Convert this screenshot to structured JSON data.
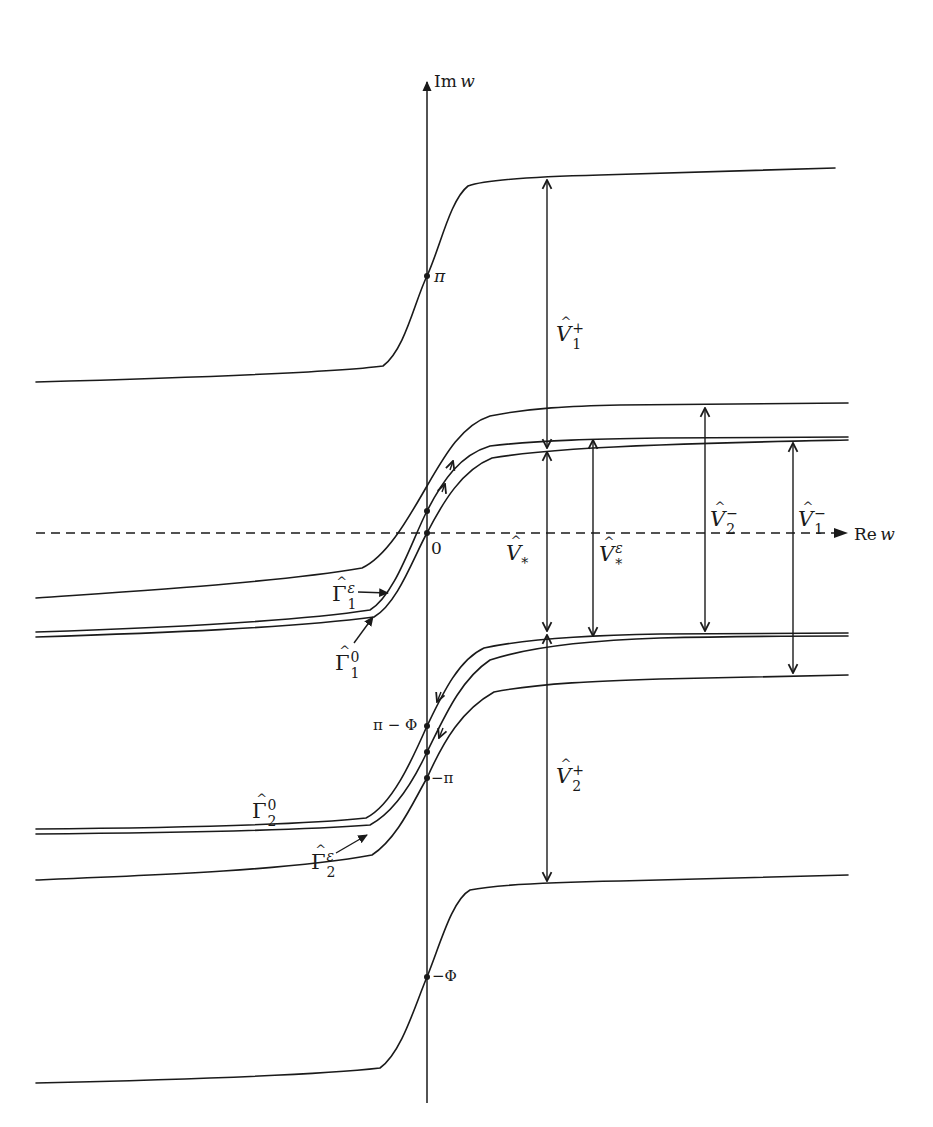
{
  "page": {
    "clipped_header_text": "",
    "figure_type": "complex w-plane sketch of strip boundaries and contours"
  },
  "axes": {
    "x_label": "Re w",
    "x_label_parts": {
      "prefix": "Re",
      "var": "w"
    },
    "y_label": "Im w",
    "y_label_parts": {
      "prefix": "Im",
      "var": "w"
    },
    "origin_label": "0",
    "x_axis_style": "dashed"
  },
  "axis_points": [
    {
      "id": "pi",
      "label": "π",
      "y": 276
    },
    {
      "id": "zero",
      "label": "0",
      "y": 533
    },
    {
      "id": "pi-minus-phi",
      "label": "π − Φ",
      "y": 726
    },
    {
      "id": "minus-pi",
      "label": "−π",
      "y": 778
    },
    {
      "id": "minus-phi",
      "label": "−Φ",
      "y": 977
    }
  ],
  "curves": [
    {
      "id": "top-boundary",
      "left_y": 382,
      "right_y": 168
    },
    {
      "id": "upper-outer",
      "left_y": 598,
      "right_y": 403
    },
    {
      "id": "gamma1-0",
      "left_y": 637,
      "right_y": 440
    },
    {
      "id": "gamma1-eps",
      "left_y": 632,
      "right_y": 437
    },
    {
      "id": "gamma2-eps",
      "left_y": 834,
      "right_y": 636
    },
    {
      "id": "gamma2-0",
      "left_y": 829,
      "right_y": 633
    },
    {
      "id": "lower-outer",
      "left_y": 880,
      "right_y": 675
    },
    {
      "id": "bottom-boundary",
      "left_y": 1083,
      "right_y": 875
    }
  ],
  "contour_labels": [
    {
      "id": "gamma1-eps",
      "base": "Γ",
      "hat": true,
      "sub": "1",
      "sup": "ε"
    },
    {
      "id": "gamma1-0",
      "base": "Γ",
      "hat": true,
      "sub": "1",
      "sup": "0"
    },
    {
      "id": "gamma2-0",
      "base": "Γ",
      "hat": true,
      "sub": "2",
      "sup": "0"
    },
    {
      "id": "gamma2-eps",
      "base": "Γ",
      "hat": true,
      "sub": "2",
      "sup": "ε"
    }
  ],
  "measurements": [
    {
      "id": "V1-plus",
      "base": "V",
      "hat": true,
      "sub": "1",
      "sup": "+",
      "x": 547,
      "from_y": 177,
      "to_y": 450
    },
    {
      "id": "V-star",
      "base": "V",
      "hat": true,
      "sub": "*",
      "sup": "",
      "x": 547,
      "from_y": 450,
      "to_y": 633
    },
    {
      "id": "V-star-eps",
      "base": "V",
      "hat": true,
      "sub": "*",
      "sup": "ε",
      "x": 593,
      "from_y": 438,
      "to_y": 638
    },
    {
      "id": "V2-minus",
      "base": "V",
      "hat": true,
      "sub": "2",
      "sup": "−",
      "x": 705,
      "from_y": 406,
      "to_y": 633
    },
    {
      "id": "V1-minus",
      "base": "V",
      "hat": true,
      "sub": "1",
      "sup": "−",
      "x": 793,
      "from_y": 441,
      "to_y": 675
    },
    {
      "id": "V2-plus",
      "base": "V",
      "hat": true,
      "sub": "2",
      "sup": "+",
      "x": 547,
      "from_y": 633,
      "to_y": 883
    }
  ]
}
